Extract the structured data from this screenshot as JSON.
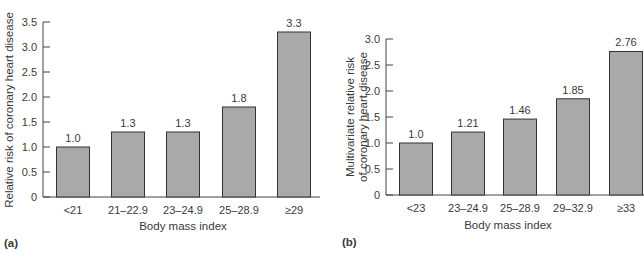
{
  "chart_data": [
    {
      "type": "bar",
      "panel": "(a)",
      "categories": [
        "<21",
        "21–22.9",
        "23–24.9",
        "25–28.9",
        "≥29"
      ],
      "values": [
        1.0,
        1.3,
        1.3,
        1.8,
        3.3
      ],
      "value_labels": [
        "1.0",
        "1.3",
        "1.3",
        "1.8",
        "3.3"
      ],
      "title": "",
      "xlabel": "Body mass index",
      "ylabel": "Relative risk of coronary heart disease",
      "ylim": [
        0,
        3.5
      ],
      "yticks": [
        "0",
        "0.5",
        "1.0",
        "1.5",
        "2.0",
        "2.5",
        "3.0",
        "3.5"
      ],
      "grid": false,
      "bar_color": "#a9a9a9"
    },
    {
      "type": "bar",
      "panel": "(b)",
      "categories": [
        "<23",
        "23–24.9",
        "25–28.9",
        "29–32.9",
        "≥33"
      ],
      "values": [
        1.0,
        1.21,
        1.46,
        1.85,
        2.76
      ],
      "value_labels": [
        "1.0",
        "1.21",
        "1.46",
        "1.85",
        "2.76"
      ],
      "title": "",
      "xlabel": "Body mass index",
      "ylabel": [
        "Multivariate relative risk",
        "of coronary heart disease"
      ],
      "ylim": [
        0,
        3.0
      ],
      "yticks": [
        "0",
        "0.5",
        "1.0",
        "1.5",
        "2.0",
        "2.5",
        "3.0"
      ],
      "grid": false,
      "bar_color": "#a9a9a9"
    }
  ],
  "panels": {
    "a": {
      "label": "(a)"
    },
    "b": {
      "label": "(b)"
    }
  }
}
